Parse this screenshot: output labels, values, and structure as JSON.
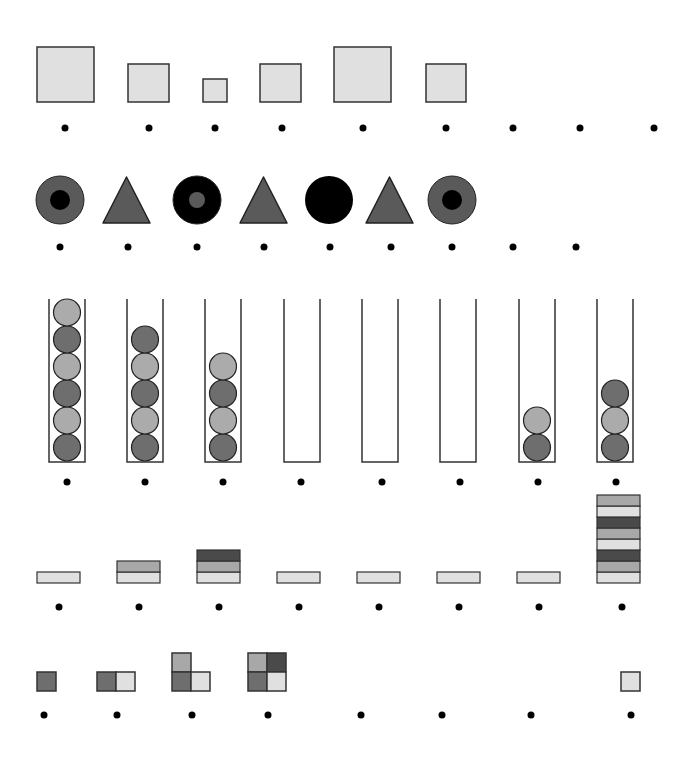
{
  "colors": {
    "light": "#e0e0e0",
    "mid": "#a8a8a8",
    "dark": "#6e6e6e",
    "darker": "#4a4a4a",
    "shape_gray": "#5a5a5a",
    "black": "#000000",
    "stroke": "#333333",
    "ball_light": "#ababab",
    "ball_dark": "#6e6e6e"
  },
  "rows": [
    {
      "name": "squares",
      "dot_y": 128,
      "dots_x": [
        65,
        149,
        215,
        282,
        363,
        446,
        513,
        580,
        654
      ],
      "items": [
        {
          "x": 37,
          "y": 47,
          "w": 57,
          "h": 55
        },
        {
          "x": 128,
          "y": 64,
          "w": 41,
          "h": 38
        },
        {
          "x": 203,
          "y": 79,
          "w": 24,
          "h": 23
        },
        {
          "x": 260,
          "y": 64,
          "w": 41,
          "h": 38
        },
        {
          "x": 334,
          "y": 47,
          "w": 57,
          "h": 55
        },
        {
          "x": 426,
          "y": 64,
          "w": 40,
          "h": 38
        }
      ]
    },
    {
      "name": "shapes",
      "dot_y": 247,
      "dots_x": [
        60,
        128,
        197,
        264,
        330,
        391,
        452,
        513,
        576
      ],
      "items": [
        {
          "type": "ring",
          "cx": 60,
          "cy": 200,
          "r": 24,
          "outer": "shape_gray",
          "inner": "black",
          "ir": 10
        },
        {
          "type": "triangle",
          "x1": 103,
          "x2": 150,
          "top": 177,
          "bottom": 223
        },
        {
          "type": "ring",
          "cx": 197,
          "cy": 200,
          "r": 24,
          "outer": "black",
          "inner": "shape_gray",
          "ir": 8
        },
        {
          "type": "triangle",
          "x1": 240,
          "x2": 287,
          "top": 177,
          "bottom": 223
        },
        {
          "type": "circle",
          "cx": 329,
          "cy": 200,
          "r": 24,
          "fill": "black"
        },
        {
          "type": "triangle",
          "x1": 366,
          "x2": 413,
          "top": 177,
          "bottom": 223
        },
        {
          "type": "ring",
          "cx": 452,
          "cy": 200,
          "r": 24,
          "outer": "shape_gray",
          "inner": "black",
          "ir": 10
        }
      ]
    },
    {
      "name": "tubes",
      "dot_y": 482,
      "top": 299,
      "bottom": 462,
      "tube_width": 36,
      "ball_r": 13.5,
      "tubes": [
        {
          "x": 49,
          "dot_x": 67,
          "balls": [
            "dark",
            "light",
            "dark",
            "light",
            "dark",
            "light"
          ]
        },
        {
          "x": 127,
          "dot_x": 145,
          "balls": [
            "dark",
            "light",
            "dark",
            "light",
            "dark"
          ]
        },
        {
          "x": 205,
          "dot_x": 223,
          "balls": [
            "dark",
            "light",
            "dark",
            "light"
          ]
        },
        {
          "x": 284,
          "dot_x": 301,
          "balls": []
        },
        {
          "x": 362,
          "dot_x": 382,
          "balls": []
        },
        {
          "x": 440,
          "dot_x": 460,
          "balls": []
        },
        {
          "x": 519,
          "dot_x": 538,
          "balls": [
            "dark",
            "light"
          ]
        },
        {
          "x": 597,
          "dot_x": 616,
          "balls": [
            "dark",
            "light",
            "dark"
          ]
        }
      ]
    },
    {
      "name": "bar-stacks",
      "dot_y": 607,
      "bottom": 583,
      "layer_h": 11,
      "bar_w": 43,
      "stacks": [
        {
          "x": 37,
          "dot_x": 59,
          "layers": [
            "light"
          ]
        },
        {
          "x": 117,
          "dot_x": 139,
          "layers": [
            "light",
            "mid"
          ]
        },
        {
          "x": 197,
          "dot_x": 219,
          "layers": [
            "light",
            "mid",
            "darker"
          ]
        },
        {
          "x": 277,
          "dot_x": 299,
          "layers": [
            "light"
          ]
        },
        {
          "x": 357,
          "dot_x": 379,
          "layers": [
            "light"
          ]
        },
        {
          "x": 437,
          "dot_x": 459,
          "layers": [
            "light"
          ]
        },
        {
          "x": 517,
          "dot_x": 539,
          "layers": [
            "light"
          ]
        },
        {
          "x": 597,
          "dot_x": 622,
          "layers": [
            "light",
            "mid",
            "darker",
            "light",
            "mid",
            "darker",
            "light",
            "mid"
          ]
        }
      ]
    },
    {
      "name": "tile-groups",
      "dot_y": 715,
      "dots_x": [
        44,
        117,
        192,
        268,
        361,
        442,
        531,
        631
      ],
      "cell": 19,
      "groups": [
        {
          "cells": [
            {
              "x": 37,
              "y": 672,
              "c": "dark"
            }
          ]
        },
        {
          "cells": [
            {
              "x": 97,
              "y": 672,
              "c": "dark"
            },
            {
              "x": 116,
              "y": 672,
              "c": "light"
            }
          ]
        },
        {
          "cells": [
            {
              "x": 172,
              "y": 653,
              "c": "mid"
            },
            {
              "x": 172,
              "y": 672,
              "c": "dark"
            },
            {
              "x": 191,
              "y": 672,
              "c": "light"
            }
          ]
        },
        {
          "cells": [
            {
              "x": 248,
              "y": 653,
              "c": "mid"
            },
            {
              "x": 267,
              "y": 653,
              "c": "darker"
            },
            {
              "x": 248,
              "y": 672,
              "c": "dark"
            },
            {
              "x": 267,
              "y": 672,
              "c": "light"
            }
          ]
        },
        {
          "cells": [
            {
              "x": 621,
              "y": 672,
              "c": "light"
            }
          ]
        }
      ]
    }
  ],
  "dot_r": 3.5
}
